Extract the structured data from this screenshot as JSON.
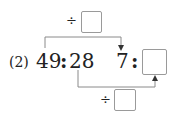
{
  "problem": {
    "label": "(2)",
    "left_ratio": {
      "a": "49",
      "sep": ":",
      "b": "28"
    },
    "right_ratio": {
      "a": "7",
      "sep": ":",
      "b": ""
    },
    "top_operation": {
      "symbol": "÷",
      "value": ""
    },
    "bottom_operation": {
      "symbol": "÷",
      "value": ""
    }
  },
  "colors": {
    "line": "#8a8a8a",
    "text": "#222222",
    "box_border": "#9a9a9a"
  }
}
